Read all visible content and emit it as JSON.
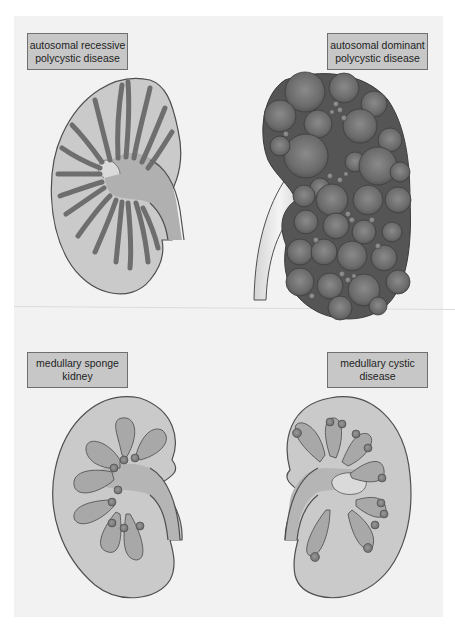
{
  "figure": {
    "panels": [
      {
        "id": "arpkd",
        "label_lines": [
          "autosomal recessive",
          "polycystic disease"
        ],
        "description": "kidney with radially elongated dilated collecting ducts"
      },
      {
        "id": "adpkd",
        "label_lines": [
          "autosomal dominant",
          "polycystic disease"
        ],
        "description": "enlarged kidney replaced by numerous spherical cysts"
      },
      {
        "id": "msk",
        "label_lines": [
          "medullary sponge",
          "kidney"
        ],
        "description": "kidney with small cysts at papillary tips"
      },
      {
        "id": "mcd",
        "label_lines": [
          "medullary cystic",
          "disease"
        ],
        "description": "kidney with small cysts at corticomedullary junction"
      }
    ]
  },
  "colors": {
    "background": "#f2f2f2",
    "label_fill": "#c7c7c7",
    "label_border": "#6f6f6f",
    "cortex": "#cacaca",
    "medulla": "#a8a8a8",
    "pelvis": "#b5b5b5",
    "outline": "#4f4f4f",
    "tubule": "#8a8a8a",
    "cyst": "#6a6a6a",
    "ureter_light": "#e0e0e0"
  }
}
